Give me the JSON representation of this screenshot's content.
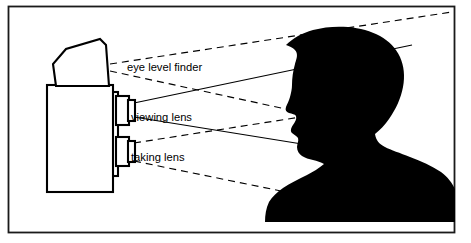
{
  "figure": {
    "background_color": "#ffffff",
    "ink_color": "#000000",
    "border": {
      "present": true,
      "color": "#1a1a1a",
      "x": 8,
      "y": 6,
      "width": 447,
      "height": 227
    }
  },
  "labels": {
    "eye_level_finder": "eye level finder",
    "viewing_lens": "viewing lens",
    "taking_lens": "taking lens"
  },
  "label_positions": {
    "eye_level_finder": {
      "x": 127,
      "y": 68
    },
    "viewing_lens": {
      "x": 131,
      "y": 118
    },
    "taking_lens": {
      "x": 131,
      "y": 158
    }
  },
  "camera": {
    "name": "twin-lens-reflex-camera",
    "body": {
      "x": 47,
      "y": 85,
      "width": 69,
      "height": 107
    },
    "hood": [
      [
        58,
        85
      ],
      [
        55,
        62
      ],
      [
        67,
        48
      ],
      [
        99,
        39
      ],
      [
        105,
        44
      ],
      [
        108,
        85
      ]
    ],
    "viewing_lens_barrel": {
      "x": 116,
      "y": 96,
      "width": 13,
      "height": 28
    },
    "viewing_lens_front": {
      "x": 129,
      "y": 100,
      "width": 6,
      "height": 20
    },
    "taking_lens_barrel": {
      "x": 116,
      "y": 137,
      "width": 13,
      "height": 28
    },
    "taking_lens_front": {
      "x": 129,
      "y": 141,
      "width": 6,
      "height": 20
    },
    "lens_plate": {
      "x": 110,
      "y": 92,
      "width": 8,
      "height": 84
    }
  },
  "rays": [
    {
      "name": "finder-upper-ray",
      "style": "dashed",
      "from": [
        110,
        64
      ],
      "to": [
        452,
        12
      ]
    },
    {
      "name": "finder-lower-ray",
      "style": "dashed",
      "from": [
        110,
        71
      ],
      "to": [
        330,
        118
      ]
    },
    {
      "name": "viewing-lens-upper-ray",
      "style": "solid",
      "from": [
        134,
        103
      ],
      "to": [
        412,
        45
      ]
    },
    {
      "name": "viewing-lens-lower-ray",
      "style": "solid",
      "from": [
        134,
        117
      ],
      "to": [
        330,
        148
      ]
    },
    {
      "name": "taking-lens-upper-ray",
      "style": "dashed",
      "from": [
        134,
        143
      ],
      "to": [
        330,
        112
      ]
    },
    {
      "name": "taking-lens-lower-ray",
      "style": "dashed",
      "from": [
        134,
        160
      ],
      "to": [
        330,
        200
      ]
    }
  ],
  "subject": {
    "name": "child-head-silhouette",
    "description": "Filled black silhouette of a child's head in left-facing profile with shoulders",
    "color": "#000000",
    "facing": "left",
    "bounds": {
      "x": 285,
      "y": 65,
      "width": 165,
      "height": 158
    }
  }
}
